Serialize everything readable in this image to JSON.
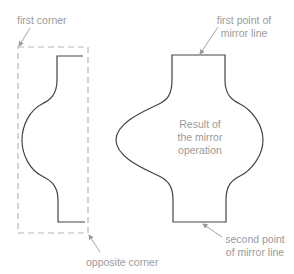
{
  "labels": {
    "first_corner": "first corner",
    "opposite_corner": "opposite corner",
    "first_point_line1": "first point of",
    "first_point_line2": "mirror line",
    "second_point_line1": "second point",
    "second_point_line2": "of mirror line",
    "result_line1": "Result of",
    "result_line2": "the mirror",
    "result_line3": "operation"
  },
  "colors": {
    "outline": "#444444",
    "selection_box": "#b8b8b8",
    "annotation": "#9a9a9a"
  }
}
